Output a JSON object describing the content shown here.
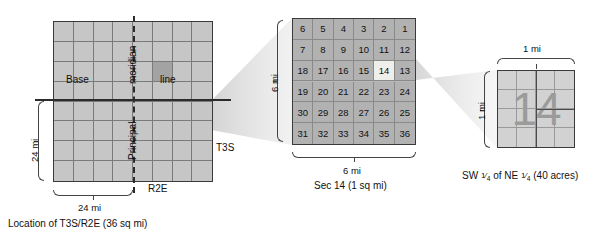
{
  "township": {
    "rows": 8,
    "cols": 8,
    "base_label": "Base",
    "line_label": "line",
    "meridian_label": "meridian",
    "principal_label": "Principal",
    "range_label": "R2E",
    "township_label": "T3S",
    "height_label": "24 mi",
    "width_label": "24 mi",
    "caption": "Location of T3S/R2E (36 sq mi)",
    "target_cell": {
      "row": 3,
      "col": 6
    }
  },
  "section": {
    "rows": 6,
    "cols": 6,
    "numbers": [
      [
        "6",
        "5",
        "4",
        "3",
        "2",
        "1"
      ],
      [
        "7",
        "8",
        "9",
        "10",
        "11",
        "12"
      ],
      [
        "18",
        "17",
        "16",
        "15",
        "14",
        "13"
      ],
      [
        "19",
        "20",
        "21",
        "22",
        "23",
        "24"
      ],
      [
        "30",
        "29",
        "28",
        "27",
        "26",
        "25"
      ],
      [
        "31",
        "32",
        "33",
        "34",
        "35",
        "36"
      ]
    ],
    "highlighted": "14",
    "height_label": "6 mi",
    "width_label": "6 mi",
    "caption": "Sec 14 (1 sq mi)"
  },
  "quarter": {
    "rows": 4,
    "cols": 4,
    "big_number": "14",
    "width_label": "1 mi",
    "height_label": "1 mi",
    "caption_parts": {
      "lead": "SW",
      "frac1_num": "1",
      "frac1_den": "4",
      "mid": "of NE",
      "frac2_num": "1",
      "frac2_den": "4",
      "tail": "(40 acres)"
    },
    "caption_plain": "SW 1/4 of NE 1/4 (40 acres)"
  },
  "colors": {
    "township_fill": "#c6c6c6",
    "section_fill": "#b2b2b2",
    "quarter_fill": "#d2d2d2",
    "highlight": "#eeeeea",
    "target": "#a3a3a3",
    "ink": "#111111"
  }
}
